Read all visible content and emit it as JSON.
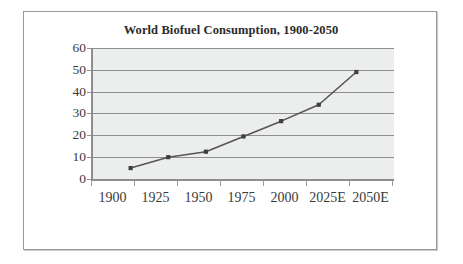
{
  "chart_data": {
    "type": "line",
    "title": "World Biofuel Consumption, 1900-2050",
    "subtitle": "",
    "xlabel": "",
    "ylabel": "",
    "categories": [
      "1900",
      "1925",
      "1950",
      "1975",
      "2000",
      "2025E",
      "2050E"
    ],
    "values": [
      5,
      10,
      12.5,
      19.5,
      26.5,
      34,
      49
    ],
    "series": [
      {
        "name": "World Biofuel Consumption",
        "values": [
          5,
          10,
          12.5,
          19.5,
          26.5,
          34,
          49
        ]
      }
    ],
    "ylim": [
      0,
      60
    ],
    "y_ticks": [
      "0",
      "10",
      "20",
      "30",
      "40",
      "50",
      "60"
    ],
    "grid": true,
    "legend": false,
    "legend_position": "none",
    "marker": "square",
    "colors": {
      "line": "#555555",
      "marker": "#3f3f3f",
      "plot_background": "#eceded",
      "gridline": "#8f8f8f",
      "axis": "#8d8d8d",
      "text": "#3a3a3a",
      "title": "#2b2b2b",
      "frame_border": "#9a9a9a",
      "page_background": "#ffffff"
    }
  }
}
